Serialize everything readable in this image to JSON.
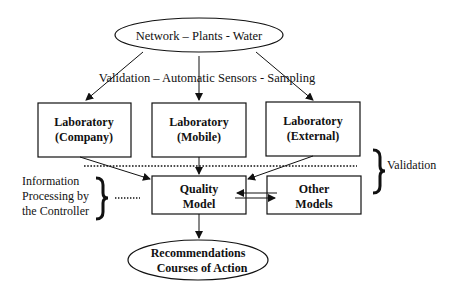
{
  "diagram": {
    "source_node": {
      "label": "Network – Plants - Water"
    },
    "edge_label": "Validation – Automatic Sensors - Sampling",
    "laboratories": [
      {
        "line1": "Laboratory",
        "line2": "(Company)"
      },
      {
        "line1": "Laboratory",
        "line2": "(Mobile)"
      },
      {
        "line1": "Laboratory",
        "line2": "(External)"
      }
    ],
    "validation_label": "Validation",
    "controller_label": [
      "Information",
      "Processing by",
      "the Controller"
    ],
    "quality_model": {
      "line1": "Quality",
      "line2": "Model"
    },
    "other_models": {
      "line1": "Other",
      "line2": "Models"
    },
    "output_node": {
      "line1": "Recommendations",
      "line2": "Courses of Action"
    }
  }
}
